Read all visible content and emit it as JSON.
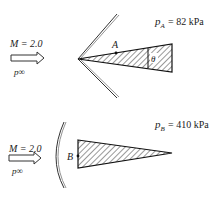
{
  "diagram": {
    "top": {
      "mach_label": "M = 2.0",
      "freestream_label": "p∞",
      "point_label": "A",
      "angle_label": "θ",
      "pressure_label": "p",
      "pressure_sub": "A",
      "pressure_value": " = 82 kPa",
      "shock_type": "oblique shock (attached)"
    },
    "bottom": {
      "mach_label": "M = 2.0",
      "freestream_label": "p∞",
      "point_label": "B",
      "pressure_label": "p",
      "pressure_sub": "B",
      "pressure_value": " = 410 kPa",
      "shock_type": "bow shock (detached)"
    },
    "colors": {
      "ink": "#222222",
      "background": "#ffffff"
    }
  }
}
